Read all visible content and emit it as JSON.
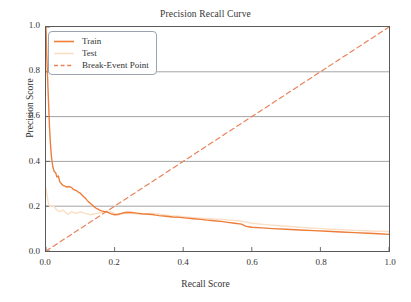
{
  "chart_data": {
    "type": "line",
    "title": "Precision Recall Curve",
    "xlabel": "Recall Score",
    "ylabel": "Precision Score",
    "xlim": [
      0.0,
      1.0
    ],
    "ylim": [
      0.0,
      1.0
    ],
    "xticks": [
      "0.0",
      "0.2",
      "0.4",
      "0.6",
      "0.8",
      "1.0"
    ],
    "yticks": [
      "0.0",
      "0.2",
      "0.4",
      "0.6",
      "0.8",
      "1.0"
    ],
    "grid": "horizontal",
    "legend_position": "upper-left",
    "colors": {
      "train": "#ED7D3A",
      "test": "#FADFC6",
      "break_even": "#E8825A",
      "grid": "#8c8c8c",
      "axis": "#5a5a5a",
      "text": "#333333",
      "background": "#ffffff"
    },
    "series": [
      {
        "name": "Train",
        "style": "solid",
        "color": "#ED7D3A",
        "x": [
          0.0,
          0.002,
          0.004,
          0.006,
          0.008,
          0.01,
          0.012,
          0.014,
          0.016,
          0.018,
          0.02,
          0.024,
          0.028,
          0.032,
          0.036,
          0.04,
          0.045,
          0.05,
          0.055,
          0.06,
          0.065,
          0.07,
          0.075,
          0.08,
          0.085,
          0.09,
          0.095,
          0.1,
          0.105,
          0.11,
          0.115,
          0.12,
          0.125,
          0.13,
          0.135,
          0.14,
          0.145,
          0.15,
          0.155,
          0.16,
          0.165,
          0.17,
          0.175,
          0.18,
          0.19,
          0.2,
          0.21,
          0.22,
          0.23,
          0.24,
          0.25,
          0.26,
          0.27,
          0.28,
          0.29,
          0.3,
          0.31,
          0.32,
          0.33,
          0.35,
          0.37,
          0.39,
          0.41,
          0.43,
          0.45,
          0.47,
          0.49,
          0.51,
          0.53,
          0.55,
          0.57,
          0.58,
          0.59,
          0.6,
          0.63,
          0.66,
          0.7,
          0.74,
          0.78,
          0.82,
          0.86,
          0.9,
          0.94,
          0.97,
          1.0
        ],
        "y": [
          1.0,
          0.88,
          0.8,
          0.72,
          0.64,
          0.56,
          0.5,
          0.455,
          0.42,
          0.395,
          0.375,
          0.355,
          0.35,
          0.33,
          0.335,
          0.31,
          0.3,
          0.292,
          0.29,
          0.285,
          0.288,
          0.286,
          0.283,
          0.275,
          0.272,
          0.268,
          0.262,
          0.258,
          0.25,
          0.242,
          0.235,
          0.226,
          0.218,
          0.212,
          0.205,
          0.198,
          0.192,
          0.188,
          0.184,
          0.18,
          0.178,
          0.176,
          0.175,
          0.172,
          0.166,
          0.162,
          0.163,
          0.168,
          0.172,
          0.173,
          0.172,
          0.17,
          0.168,
          0.166,
          0.165,
          0.164,
          0.163,
          0.16,
          0.158,
          0.155,
          0.152,
          0.15,
          0.147,
          0.144,
          0.141,
          0.138,
          0.135,
          0.132,
          0.128,
          0.124,
          0.12,
          0.112,
          0.108,
          0.106,
          0.103,
          0.1,
          0.097,
          0.094,
          0.091,
          0.088,
          0.085,
          0.082,
          0.079,
          0.077,
          0.074
        ]
      },
      {
        "name": "Test",
        "style": "solid",
        "color": "#FADFC6",
        "x": [
          0.0,
          0.004,
          0.008,
          0.012,
          0.016,
          0.02,
          0.025,
          0.03,
          0.035,
          0.04,
          0.045,
          0.05,
          0.055,
          0.06,
          0.065,
          0.07,
          0.075,
          0.08,
          0.085,
          0.09,
          0.095,
          0.1,
          0.11,
          0.12,
          0.13,
          0.14,
          0.15,
          0.16,
          0.17,
          0.18,
          0.19,
          0.2,
          0.22,
          0.24,
          0.26,
          0.28,
          0.3,
          0.32,
          0.34,
          0.36,
          0.38,
          0.4,
          0.44,
          0.48,
          0.52,
          0.56,
          0.58,
          0.6,
          0.64,
          0.68,
          0.72,
          0.76,
          0.8,
          0.85,
          0.9,
          0.95,
          1.0
        ],
        "y": [
          0.28,
          0.24,
          0.205,
          0.198,
          0.2,
          0.202,
          0.196,
          0.186,
          0.178,
          0.176,
          0.18,
          0.182,
          0.175,
          0.168,
          0.164,
          0.17,
          0.175,
          0.172,
          0.168,
          0.17,
          0.172,
          0.174,
          0.17,
          0.166,
          0.162,
          0.165,
          0.168,
          0.172,
          0.176,
          0.178,
          0.174,
          0.168,
          0.166,
          0.168,
          0.166,
          0.164,
          0.168,
          0.166,
          0.162,
          0.158,
          0.156,
          0.153,
          0.148,
          0.144,
          0.14,
          0.135,
          0.13,
          0.124,
          0.118,
          0.113,
          0.108,
          0.104,
          0.1,
          0.096,
          0.092,
          0.089,
          0.087
        ]
      },
      {
        "name": "Break-Event Point",
        "style": "dashed",
        "color": "#E8825A",
        "x": [
          0.0,
          1.0
        ],
        "y": [
          0.0,
          1.0
        ]
      }
    ],
    "legend": [
      {
        "label": "Train",
        "color": "#ED7D3A",
        "style": "solid"
      },
      {
        "label": "Test",
        "color": "#FADFC6",
        "style": "solid"
      },
      {
        "label": "Break-Event Point",
        "color": "#E8825A",
        "style": "dashed"
      }
    ]
  }
}
